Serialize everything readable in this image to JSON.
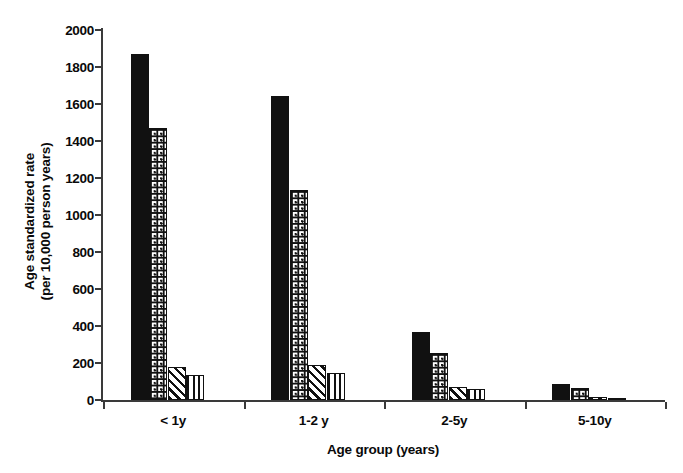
{
  "chart_data": {
    "type": "bar",
    "title": "",
    "xlabel": "Age group (years)",
    "ylabel": "Age standardized rate (per 10,000 person years)",
    "ylabel_lines": [
      "Age standardized rate",
      "(per 10,000 person years)"
    ],
    "categories": [
      "< 1y",
      "1-2 y",
      "2-5y",
      "5-10y"
    ],
    "series": [
      {
        "name": "series-1",
        "pattern": "solid-black",
        "values": [
          1870,
          1645,
          370,
          85
        ]
      },
      {
        "name": "series-2",
        "pattern": "checkered-dots",
        "values": [
          1470,
          1135,
          255,
          65
        ]
      },
      {
        "name": "series-3",
        "pattern": "diagonal-stripes",
        "values": [
          180,
          188,
          68,
          14
        ]
      },
      {
        "name": "series-4",
        "pattern": "vertical-stripes",
        "values": [
          135,
          145,
          60,
          12
        ]
      }
    ],
    "ylim": [
      0,
      2000
    ],
    "yticks": [
      0,
      200,
      400,
      600,
      800,
      1000,
      1200,
      1400,
      1600,
      1800,
      2000
    ],
    "ytick_labels": [
      "0",
      "200",
      "400",
      "600",
      "800",
      "1000",
      "1200",
      "1400",
      "1600",
      "1800",
      "2000"
    ],
    "grid": false,
    "legend": "none",
    "axis_color": "#3a3a3a",
    "bar_color": "#111111",
    "background": "#ffffff"
  }
}
